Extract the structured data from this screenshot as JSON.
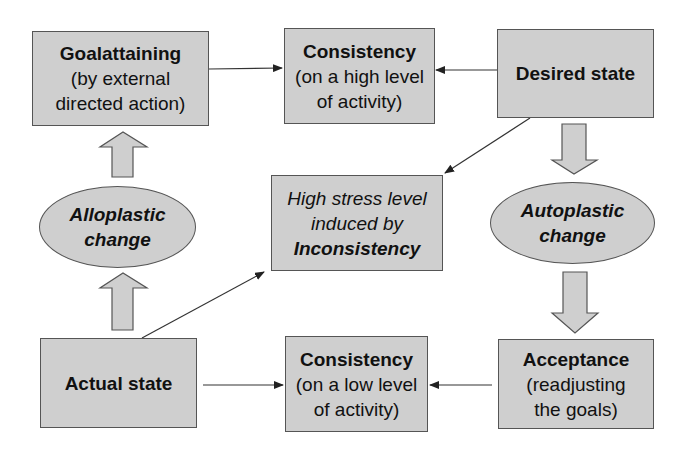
{
  "diagram": {
    "type": "flow",
    "nodes": {
      "goalattaining": {
        "title": "Goalattaining",
        "line1": "(by external",
        "line2": "directed action)"
      },
      "consistency_high": {
        "title": "Consistency",
        "line1": "(on a high level",
        "line2": "of activity)"
      },
      "desired_state": {
        "title": "Desired state"
      },
      "alloplastic": {
        "line1": "Alloplastic",
        "line2": "change"
      },
      "stress": {
        "line1": "High stress level",
        "line2": "induced by",
        "line3": "Inconsistency"
      },
      "autoplastic": {
        "line1": "Autoplastic",
        "line2": "change"
      },
      "actual_state": {
        "title": "Actual state"
      },
      "consistency_low": {
        "title": "Consistency",
        "line1": "(on a low level",
        "line2": "of activity)"
      },
      "acceptance": {
        "title": "Acceptance",
        "line1": "(readjusting",
        "line2": "the goals)"
      }
    },
    "edges": [
      {
        "from": "Goalattaining",
        "to": "Consistency (high level)",
        "style": "thin-arrow"
      },
      {
        "from": "Desired state",
        "to": "Consistency (high level)",
        "style": "thin-arrow"
      },
      {
        "from": "Desired state",
        "to": "High stress level",
        "style": "thin-arrow"
      },
      {
        "from": "Actual state",
        "to": "High stress level",
        "style": "thin-arrow"
      },
      {
        "from": "Actual state",
        "to": "Alloplastic change",
        "style": "block-arrow"
      },
      {
        "from": "Alloplastic change",
        "to": "Goalattaining",
        "style": "block-arrow"
      },
      {
        "from": "Desired state",
        "to": "Autoplastic change",
        "style": "block-arrow"
      },
      {
        "from": "Autoplastic change",
        "to": "Acceptance",
        "style": "block-arrow"
      },
      {
        "from": "Actual state",
        "to": "Consistency (low level)",
        "style": "thin-arrow"
      },
      {
        "from": "Acceptance",
        "to": "Consistency (low level)",
        "style": "thin-arrow"
      }
    ],
    "colors": {
      "fill": "#cfcfcf",
      "stroke": "#555555",
      "text": "#111111"
    }
  }
}
